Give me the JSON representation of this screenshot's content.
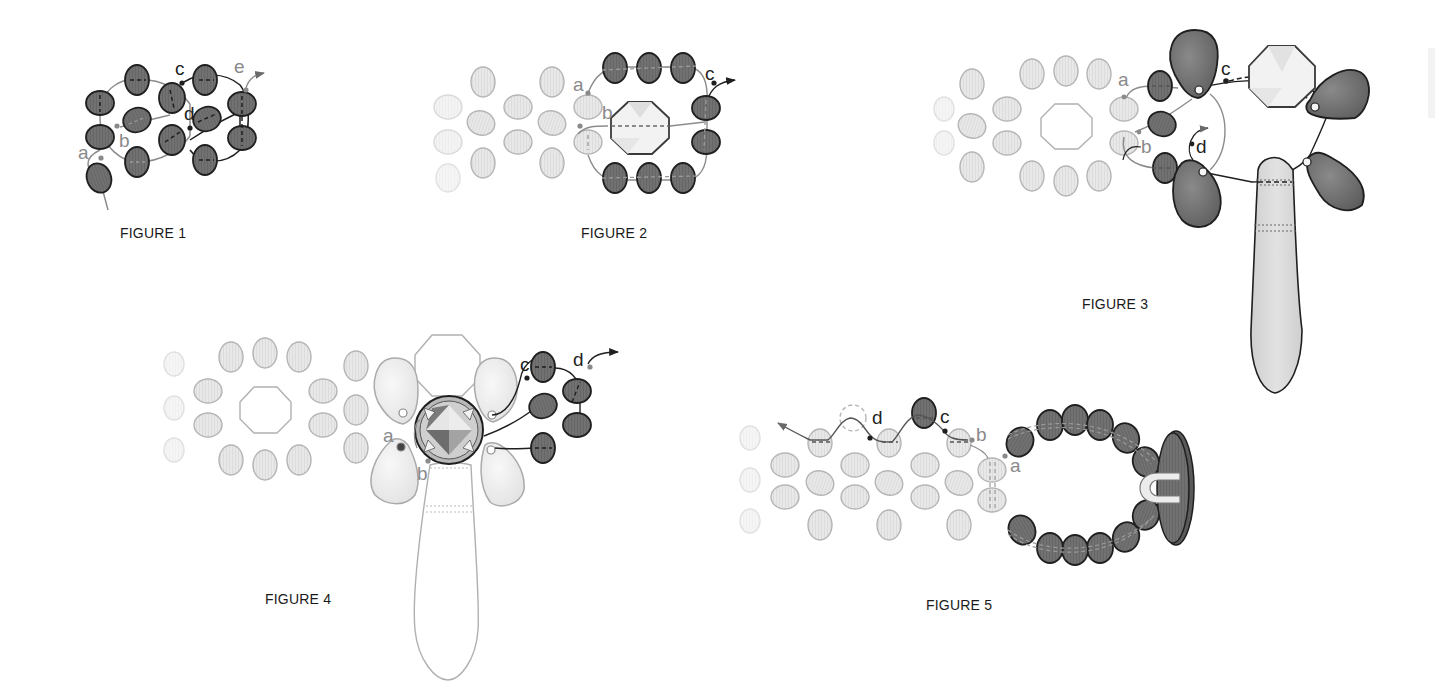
{
  "page": {
    "background": "#ffffff",
    "colors": {
      "dark_bead": "#6e6e6e",
      "light_bead": "#e6e6e6",
      "outline_dark": "#1f1f1f",
      "outline_light": "#9a9a9a",
      "thread_dark": "#1f1f1f",
      "thread_light": "#8a8a8a",
      "caption_text": "#1a1a1a"
    }
  },
  "figures": [
    {
      "id": "figure-1",
      "caption": "FIGURE 1",
      "points": {
        "a": "a",
        "b": "b",
        "c": "c",
        "d": "d",
        "e": "e"
      }
    },
    {
      "id": "figure-2",
      "caption": "FIGURE 2",
      "points": {
        "a": "a",
        "b": "b",
        "c": "c"
      }
    },
    {
      "id": "figure-3",
      "caption": "FIGURE 3",
      "points": {
        "a": "a",
        "b": "b",
        "c": "c",
        "d": "d"
      }
    },
    {
      "id": "figure-4",
      "caption": "FIGURE 4",
      "points": {
        "a": "a",
        "b": "b",
        "c": "c",
        "d": "d"
      }
    },
    {
      "id": "figure-5",
      "caption": "FIGURE 5",
      "points": {
        "a": "a",
        "b": "b",
        "c": "c",
        "d": "d"
      }
    }
  ]
}
